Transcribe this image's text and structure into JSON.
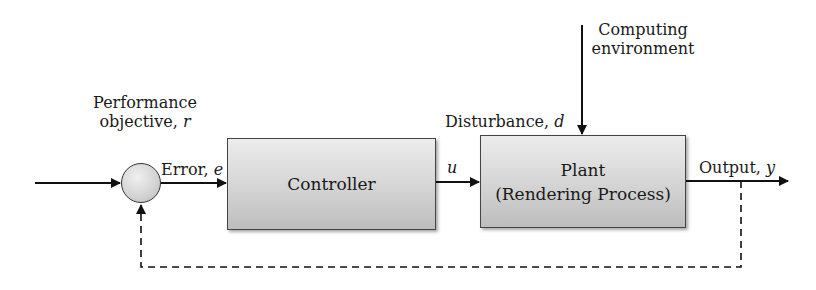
{
  "diagram": {
    "type": "feedback-control-loop",
    "nodes": {
      "summing_junction": {
        "label": ""
      },
      "controller": {
        "label": "Controller"
      },
      "plant": {
        "line1": "Plant",
        "line2": "(Rendering Process)"
      }
    },
    "labels": {
      "performance_objective": {
        "line1": "Performance",
        "line2_text": "objective, ",
        "line2_var": "r"
      },
      "error": {
        "text": "Error, ",
        "var": "e"
      },
      "control_signal": {
        "var": "u"
      },
      "disturbance": {
        "text": "Disturbance, ",
        "var": "d"
      },
      "computing_environment": {
        "line1": "Computing",
        "line2": "environment"
      },
      "output": {
        "text": "Output, ",
        "var": "y"
      }
    },
    "edges": [
      {
        "from": "performance_objective",
        "to": "summing_junction",
        "style": "solid"
      },
      {
        "from": "summing_junction",
        "to": "controller",
        "label": "Error, e",
        "style": "solid"
      },
      {
        "from": "controller",
        "to": "plant",
        "label": "u",
        "style": "solid"
      },
      {
        "from": "computing_environment",
        "to": "plant",
        "label": "Disturbance, d",
        "style": "solid"
      },
      {
        "from": "plant",
        "to": "output",
        "label": "Output, y",
        "style": "solid"
      },
      {
        "from": "output",
        "to": "summing_junction",
        "label": "feedback",
        "style": "dashed"
      }
    ],
    "colors": {
      "line": "#111111",
      "box_fill_top": "#ececec",
      "box_fill_bottom": "#bdbdbd",
      "box_border": "#444444"
    }
  }
}
